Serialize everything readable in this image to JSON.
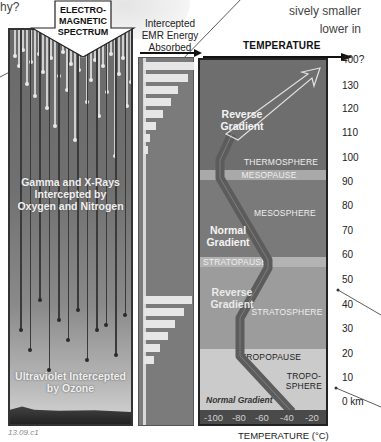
{
  "fragments": {
    "top_left": "hy?",
    "top_right_line1": "sively smaller",
    "top_right_line2": "lower in"
  },
  "spectrum_callout": {
    "line1": "ELECTRO-",
    "line2": "MAGNETIC",
    "line3": "SPECTRUM"
  },
  "left_panel": {
    "gamma_line1": "Gamma and X-Rays",
    "gamma_line2": "Intercepted by",
    "gamma_line3": "Oxygen and Nitrogen",
    "uv_line1": "Ultraviolet Intercepted",
    "uv_line2": "by Ozone"
  },
  "absorbed": {
    "title_line1": "Intercepted",
    "title_line2": "EMR Energy",
    "title_line3": "Absorbed",
    "upper_bars_px": [
      50,
      44,
      34,
      27,
      19,
      12,
      6,
      4
    ],
    "lower_bars_px": [
      48,
      40,
      31,
      24,
      16,
      10
    ]
  },
  "temperature": {
    "title": "TEMPERATURE",
    "xlabel": "TEMPERATURE (°C)",
    "ticks": [
      "-100",
      "-80",
      "-60",
      "-40",
      "-20"
    ],
    "layers": {
      "thermosphere": "THERMOSPHERE",
      "mesopause": "MESOPAUSE",
      "mesosphere": "MESOSPHERE",
      "stratopause": "STRATOPAUSE",
      "stratosphere": "STRATOSPHERE",
      "tropopause": "TROPOPAUSE",
      "troposphere_line1": "TROPO-",
      "troposphere_line2": "SPHERE"
    },
    "gradients": {
      "reverse_top_1": "Reverse",
      "reverse_top_2": "Gradient",
      "normal_mid_1": "Normal",
      "normal_mid_2": "Gradient",
      "reverse_low_1": "Reverse",
      "reverse_low_2": "Gradient",
      "normal_bottom": "Normal Gradient"
    }
  },
  "altitude_axis": {
    "ticks": [
      "400?",
      "130",
      "120",
      "110",
      "100",
      "90",
      "80",
      "70",
      "60",
      "50",
      "40",
      "30",
      "20",
      "10",
      "0 km"
    ]
  },
  "figure_id": "13.09.c1",
  "colors": {
    "panel_dark": "#6b6b6b",
    "pause_band": "#a8a8a8",
    "stratosphere": "#9a9a9a",
    "troposphere": "#c9c9c9",
    "profile_line": "#5a5a5a"
  }
}
